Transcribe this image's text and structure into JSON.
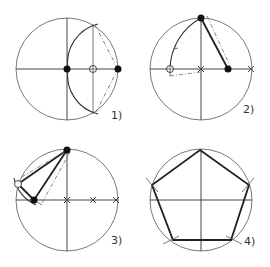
{
  "diagram": {
    "steps": [
      {
        "label": "1)"
      },
      {
        "label": "2)"
      },
      {
        "label": "3)"
      },
      {
        "label": "4)"
      }
    ],
    "colors": {
      "line": "#444444",
      "bold": "#222222",
      "background": "#ffffff"
    }
  }
}
